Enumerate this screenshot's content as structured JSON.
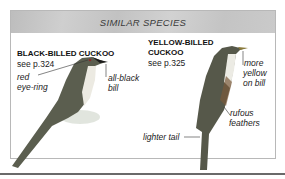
{
  "panel": {
    "title": "SIMILAR SPECIES"
  },
  "species": [
    {
      "name": "BLACK-BILLED CUCKOO",
      "ref": "see p.324",
      "labels": [
        "red eye-ring",
        "all-black bill"
      ],
      "label_lines": {
        "red_1": "red",
        "red_2": "eye-ring",
        "bill_1": "all-black",
        "bill_2": "bill"
      }
    },
    {
      "name_line1": "YELLOW-BILLED",
      "name_line2": "CUCKOO",
      "ref": "see p.325",
      "label_lines": {
        "more_1": "more",
        "more_2": "yellow",
        "more_3": "on bill",
        "ruf_1": "rufous",
        "ruf_2": "feathers",
        "tail": "lighter tail"
      }
    }
  ]
}
